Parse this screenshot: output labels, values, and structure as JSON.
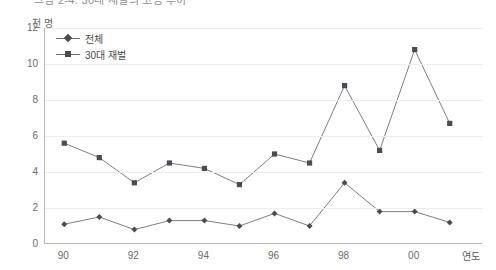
{
  "title": "그림 2-4. 30대 재벌의 고용 추이",
  "axes": {
    "y_unit": "천 명",
    "x_title": "연도",
    "y_ticks": [
      "12",
      "10",
      "8",
      "6",
      "4",
      "2",
      "0"
    ],
    "x_ticks": [
      "90",
      "92",
      "94",
      "96",
      "98",
      "00"
    ]
  },
  "legend": {
    "items": [
      {
        "label": "전체",
        "marker": "diamond",
        "color": "#4b4b55"
      },
      {
        "label": "30대 재벌",
        "marker": "square",
        "color": "#4b4b55"
      }
    ]
  },
  "colors": {
    "line": "#6e6e7a",
    "marker": "#4b4b55",
    "grid": "#ededf0",
    "axis": "#b9b9bd",
    "text": "#6b6b6b"
  },
  "chart_data": {
    "type": "line",
    "title": "그림 2-4. 30대 재벌의 고용 추이",
    "xlabel": "연도",
    "ylabel": "천 명",
    "ylim": [
      0,
      12
    ],
    "grid": true,
    "legend_position": "top-left",
    "x": [
      1990,
      1991,
      1992,
      1993,
      1994,
      1995,
      1996,
      1997,
      1998,
      1999,
      2000,
      2001
    ],
    "x_tick_labels": [
      "90",
      "91",
      "92",
      "93",
      "94",
      "95",
      "96",
      "97",
      "98",
      "99",
      "00",
      "01"
    ],
    "series": [
      {
        "name": "전체",
        "marker": "diamond",
        "values": [
          1.1,
          1.5,
          0.8,
          1.3,
          1.3,
          1.0,
          1.7,
          1.0,
          3.4,
          1.8,
          1.8,
          1.2
        ]
      },
      {
        "name": "30대 재벌",
        "marker": "square",
        "values": [
          5.6,
          4.8,
          3.4,
          4.5,
          4.2,
          3.3,
          5.0,
          4.5,
          8.8,
          5.2,
          10.8,
          6.7
        ]
      }
    ]
  }
}
